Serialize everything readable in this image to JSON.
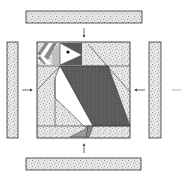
{
  "diagram": {
    "colors": {
      "outline": "#333333",
      "background_fill": "#e4e4e4",
      "speckle": "#9a9a9a",
      "dark": "#5a5a5a",
      "mid": "#9e9e9e",
      "light": "#c8c8c8",
      "white": "#ffffff",
      "arrow": "#444444"
    },
    "center_block": {
      "subject": "puffin",
      "x": 37,
      "y": 42,
      "width": 93,
      "height": 96
    },
    "border_strips": [
      {
        "id": "top",
        "x": 26,
        "y": 11,
        "width": 116,
        "height": 12
      },
      {
        "id": "bottom",
        "x": 26,
        "y": 158,
        "width": 115,
        "height": 12
      },
      {
        "id": "left",
        "x": 7,
        "y": 42,
        "width": 11,
        "height": 96
      },
      {
        "id": "right",
        "x": 149,
        "y": 42,
        "width": 12,
        "height": 96
      }
    ],
    "arrows": [
      {
        "id": "top-arrow",
        "direction": "down"
      },
      {
        "id": "bottom-arrow",
        "direction": "up"
      },
      {
        "id": "left-arrow",
        "direction": "right"
      },
      {
        "id": "right-arrow",
        "direction": "left"
      }
    ]
  }
}
